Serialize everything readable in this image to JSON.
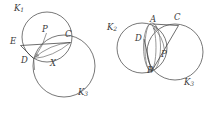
{
  "figure": {
    "background_color": "#ffffff",
    "stroke_color": "#4a4a4a",
    "label_color": "#3a3a3a",
    "width": 208,
    "height": 114
  },
  "diagrams": [
    {
      "name": "left-diagram",
      "circles": [
        {
          "name": "K1",
          "cx": 47,
          "cy": 37,
          "r": 25
        },
        {
          "name": "K3",
          "cx": 64,
          "cy": 66,
          "r": 31
        }
      ],
      "labels": [
        {
          "id": "K1",
          "text": "K",
          "sub": "1",
          "x": 14,
          "y": 5
        },
        {
          "id": "E",
          "text": "E",
          "sub": "",
          "x": 10,
          "y": 38
        },
        {
          "id": "P",
          "text": "P",
          "sub": "",
          "x": 42,
          "y": 26
        },
        {
          "id": "C",
          "text": "C",
          "sub": "",
          "x": 65,
          "y": 31
        },
        {
          "id": "D",
          "text": "D",
          "sub": "",
          "x": 21,
          "y": 57
        },
        {
          "id": "X",
          "text": "X",
          "sub": "",
          "x": 50,
          "y": 60
        },
        {
          "id": "K3",
          "text": "K",
          "sub": "3",
          "x": 78,
          "y": 89
        }
      ]
    },
    {
      "name": "right-diagram",
      "circles": [
        {
          "name": "K2",
          "cx": 142,
          "cy": 48,
          "r": 25
        },
        {
          "name": "K3",
          "cx": 175,
          "cy": 52,
          "r": 28
        }
      ],
      "labels": [
        {
          "id": "K2",
          "text": "K",
          "sub": "2",
          "x": 107,
          "y": 24
        },
        {
          "id": "A",
          "text": "A",
          "sub": "",
          "x": 150,
          "y": 16
        },
        {
          "id": "C",
          "text": "C",
          "sub": "",
          "x": 174,
          "y": 14
        },
        {
          "id": "D",
          "text": "D",
          "sub": "",
          "x": 135,
          "y": 35
        },
        {
          "id": "P",
          "text": "P",
          "sub": "",
          "x": 161,
          "y": 51
        },
        {
          "id": "B",
          "text": "B",
          "sub": "",
          "x": 147,
          "y": 67
        },
        {
          "id": "K3",
          "text": "K",
          "sub": "3",
          "x": 184,
          "y": 79
        }
      ]
    }
  ]
}
